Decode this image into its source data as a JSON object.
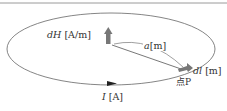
{
  "diagram": {
    "labels": {
      "dH_var": "dH",
      "dH_unit": "[A/m]",
      "a_var": "a",
      "a_unit": "[m]",
      "dl_var": "dl",
      "dl_unit": "[m]",
      "point": "点P",
      "I_var": "I",
      "I_unit": "[A]"
    },
    "colors": {
      "line": "#555555",
      "arrow": "#777777",
      "text": "#333333"
    }
  }
}
